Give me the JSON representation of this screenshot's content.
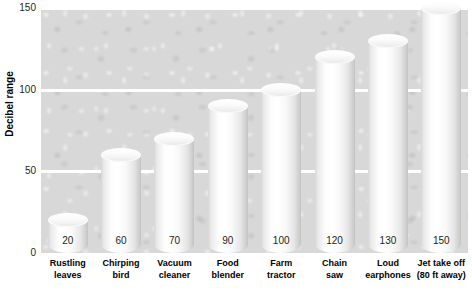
{
  "chart_data": {
    "type": "bar",
    "title": "",
    "subtitle": "",
    "xlabel": "",
    "ylabel": "Decibel range",
    "ylim": [
      0,
      150
    ],
    "yticks": [
      0,
      50,
      100,
      150
    ],
    "grid": true,
    "legend": false,
    "categories": [
      "Rustling leaves",
      "Chirping bird",
      "Vacuum cleaner",
      "Food blender",
      "Farm tractor",
      "Chain saw",
      "Loud earphones",
      "Jet take off (80 ft away)"
    ],
    "category_lines": [
      [
        "Rustling",
        "leaves"
      ],
      [
        "Chirping",
        "bird"
      ],
      [
        "Vacuum",
        "cleaner"
      ],
      [
        "Food",
        "blender"
      ],
      [
        "Farm",
        "tractor"
      ],
      [
        "Chain",
        "saw"
      ],
      [
        "Loud",
        "earphones"
      ],
      [
        "Jet take off",
        "(80 ft away)"
      ]
    ],
    "values": [
      20,
      60,
      70,
      90,
      100,
      120,
      130,
      150
    ],
    "value_labels": [
      "20",
      "60",
      "70",
      "90",
      "100",
      "120",
      "130",
      "150"
    ],
    "style": {
      "bar_shape": "cylinder-3d",
      "bar_fill": "#ffffff",
      "plot_background": "#d8d8d8",
      "gridline_color": "#ffffff",
      "text_color": "#231f20",
      "page_background": "#ffffff"
    }
  },
  "axis": {
    "y_title": "Decibel range",
    "tick_labels": [
      "150",
      "100",
      "50",
      "0"
    ]
  }
}
